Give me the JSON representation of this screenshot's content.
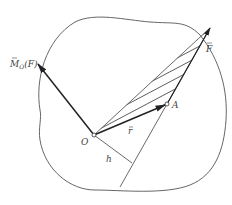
{
  "diagram": {
    "labels": {
      "moment": "M",
      "moment_sub": "O",
      "moment_arg": "(F)",
      "force": "F",
      "position": "r",
      "origin": "O",
      "point": "A",
      "arm": "h"
    },
    "colors": {
      "line": "#555555",
      "vector": "#222222",
      "background": "#ffffff"
    },
    "points": {
      "O": [
        94,
        135
      ],
      "A": [
        167,
        104
      ],
      "F_tip": [
        210,
        28
      ],
      "M_tip": [
        38,
        64
      ],
      "h_foot": [
        132,
        163
      ],
      "line_end": [
        120,
        187
      ]
    }
  }
}
